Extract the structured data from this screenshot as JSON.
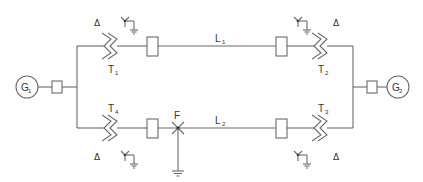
{
  "diagram": {
    "type": "single-line power system diagram",
    "colors": {
      "line": "#6b6b6b",
      "text": "#333333",
      "background": "#ffffff"
    },
    "generators": [
      {
        "id": "G1",
        "label": "G",
        "subscript": "1"
      },
      {
        "id": "G2",
        "label": "G",
        "subscript": "2"
      }
    ],
    "transformers": [
      {
        "id": "T1",
        "label": "T",
        "subscript": "1",
        "winding_left": "Δ",
        "winding_right": "Y-grounded"
      },
      {
        "id": "T2",
        "label": "T",
        "subscript": "2",
        "winding_left": "Y-grounded",
        "winding_right": "Δ"
      },
      {
        "id": "T3",
        "label": "T",
        "subscript": "3",
        "winding_left": "Y-grounded",
        "winding_right": "Δ"
      },
      {
        "id": "T4",
        "label": "T",
        "subscript": "4",
        "winding_left": "Δ",
        "winding_right": "Y-grounded"
      }
    ],
    "lines": [
      {
        "id": "L1",
        "label": "L",
        "subscript": "1"
      },
      {
        "id": "L2",
        "label": "L",
        "subscript": "2"
      }
    ],
    "fault": {
      "label": "F",
      "location": "on line L2 near T4 breaker",
      "grounded": true
    },
    "delta_symbol": "Δ",
    "breakers_count": 6
  }
}
